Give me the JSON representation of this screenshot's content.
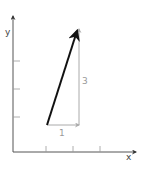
{
  "diagram": {
    "axes": {
      "x_label": "x",
      "y_label": "y",
      "x_ticks": 3,
      "y_ticks": 3
    },
    "vector": {
      "components": {
        "horizontal_label": "1",
        "vertical_label": "3"
      }
    },
    "colors": {
      "axis": "#555555",
      "vector": "#111111",
      "component": "#aaaaaa",
      "label_gray": "#999999"
    }
  }
}
